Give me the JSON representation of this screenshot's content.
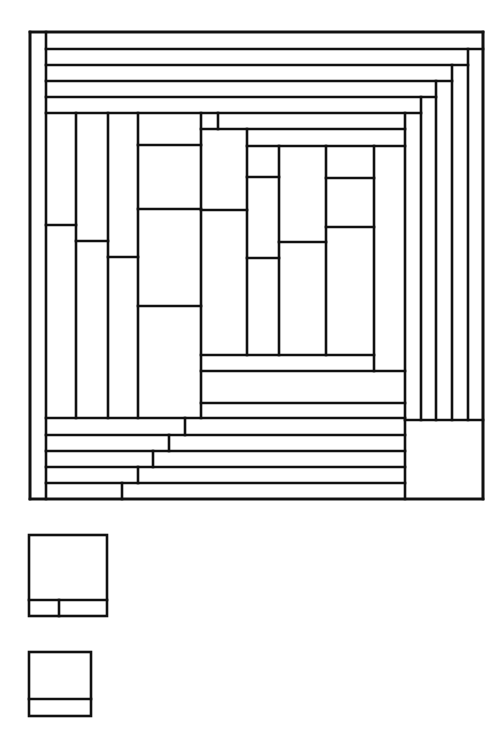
{
  "diagram": {
    "stroke_color": "#111111",
    "background_color": "#ffffff",
    "main_tiling": {
      "frame": {
        "x": 30,
        "y": 32,
        "w": 453,
        "h": 467
      },
      "segments": [
        [
          30,
          32,
          483,
          32
        ],
        [
          483,
          32,
          483,
          499
        ],
        [
          30,
          499,
          483,
          499
        ],
        [
          30,
          32,
          30,
          499
        ],
        [
          46,
          32,
          46,
          499
        ],
        [
          46,
          49,
          483,
          49
        ],
        [
          46,
          65,
          468,
          65
        ],
        [
          46,
          81,
          452,
          81
        ],
        [
          46,
          97,
          436,
          97
        ],
        [
          46,
          113,
          421,
          113
        ],
        [
          468,
          49,
          468,
          420
        ],
        [
          452,
          65,
          452,
          420
        ],
        [
          436,
          81,
          436,
          420
        ],
        [
          421,
          97,
          421,
          420
        ],
        [
          405,
          113,
          405,
          499
        ],
        [
          405,
          420,
          483,
          420
        ],
        [
          46,
          418,
          405,
          418
        ],
        [
          46,
          435,
          405,
          435
        ],
        [
          46,
          451,
          405,
          451
        ],
        [
          46,
          467,
          405,
          467
        ],
        [
          46,
          483,
          405,
          483
        ],
        [
          185,
          418,
          185,
          435
        ],
        [
          169,
          435,
          169,
          451
        ],
        [
          153,
          451,
          153,
          467
        ],
        [
          138,
          467,
          138,
          483
        ],
        [
          122,
          483,
          122,
          499
        ],
        [
          76,
          113,
          76,
          418
        ],
        [
          108,
          113,
          108,
          418
        ],
        [
          138,
          113,
          138,
          418
        ],
        [
          201,
          113,
          201,
          418
        ],
        [
          46,
          225,
          76,
          225
        ],
        [
          76,
          241,
          108,
          241
        ],
        [
          108,
          257,
          138,
          257
        ],
        [
          138,
          145,
          201,
          145
        ],
        [
          138,
          209,
          201,
          209
        ],
        [
          138,
          306,
          201,
          306
        ],
        [
          218,
          113,
          218,
          129
        ],
        [
          201,
          129,
          405,
          129
        ],
        [
          247,
          129,
          247,
          355
        ],
        [
          247,
          146,
          405,
          146
        ],
        [
          279,
          146,
          279,
          355
        ],
        [
          326,
          146,
          326,
          355
        ],
        [
          374,
          146,
          374,
          371
        ],
        [
          201,
          210,
          247,
          210
        ],
        [
          247,
          177,
          279,
          177
        ],
        [
          247,
          258,
          279,
          258
        ],
        [
          279,
          242,
          326,
          242
        ],
        [
          326,
          178,
          374,
          178
        ],
        [
          326,
          227,
          374,
          227
        ],
        [
          201,
          355,
          374,
          355
        ],
        [
          201,
          371,
          405,
          371
        ],
        [
          201,
          403,
          405,
          403
        ]
      ]
    },
    "legend_shapes": [
      {
        "name": "small-square-two-cells",
        "frame": {
          "x": 29,
          "y": 535,
          "w": 78,
          "h": 81
        },
        "segments": [
          [
            29,
            600,
            107,
            600
          ],
          [
            59,
            600,
            59,
            616
          ]
        ]
      },
      {
        "name": "small-square-one-cell",
        "frame": {
          "x": 29,
          "y": 652,
          "w": 62,
          "h": 64
        },
        "segments": [
          [
            29,
            699,
            91,
            699
          ]
        ]
      }
    ]
  }
}
